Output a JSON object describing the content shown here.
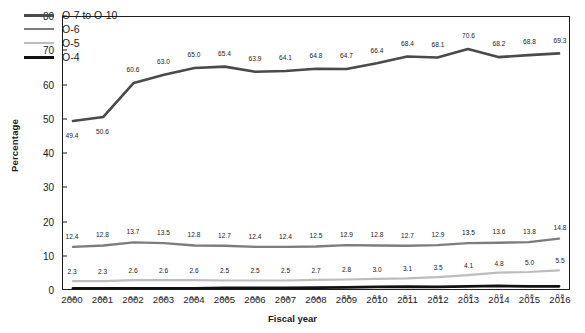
{
  "chart_data": {
    "type": "line",
    "title": "",
    "xlabel": "Fiscal year",
    "ylabel": "Percentage",
    "categories": [
      "2000",
      "2001",
      "2002",
      "2003",
      "2004",
      "2005",
      "2006",
      "2007",
      "2008",
      "2009",
      "2010",
      "2011",
      "2012",
      "2013",
      "2014",
      "2015",
      "2016"
    ],
    "ylim": [
      0,
      80
    ],
    "yticks": [
      0,
      10,
      20,
      30,
      40,
      50,
      60,
      70,
      80
    ],
    "grid": false,
    "legend_position": "top-left",
    "series": [
      {
        "name": "O-7 to O-10",
        "color": "#4a4a4a",
        "values": [
          49.4,
          50.6,
          60.6,
          63.0,
          65.0,
          65.4,
          63.9,
          64.1,
          64.8,
          64.7,
          66.4,
          68.4,
          68.1,
          70.6,
          68.2,
          68.8,
          69.3
        ],
        "labels": [
          "49.4",
          "50.6",
          "60.6",
          "63.0",
          "65.0",
          "65.4",
          "63.9",
          "64.1",
          "64.8",
          "64.7",
          "66.4",
          "68.4",
          "68.1",
          "70.6",
          "68.2",
          "68.8",
          "69.3"
        ]
      },
      {
        "name": "O-6",
        "color": "#7d7d7d",
        "values": [
          12.4,
          12.8,
          13.7,
          13.5,
          12.8,
          12.7,
          12.4,
          12.4,
          12.5,
          12.9,
          12.8,
          12.7,
          12.9,
          13.5,
          13.6,
          13.8,
          14.8
        ],
        "labels": [
          "12.4",
          "12.8",
          "13.7",
          "13.5",
          "12.8",
          "12.7",
          "12.4",
          "12.4",
          "12.5",
          "12.9",
          "12.8",
          "12.7",
          "12.9",
          "13.5",
          "13.6",
          "13.8",
          "14.8"
        ]
      },
      {
        "name": "O-5",
        "color": "#bdbdbd",
        "values": [
          2.3,
          2.3,
          2.6,
          2.6,
          2.6,
          2.5,
          2.5,
          2.5,
          2.7,
          2.8,
          3.0,
          3.1,
          3.5,
          4.1,
          4.8,
          5.0,
          5.5
        ],
        "labels": [
          "2.3",
          "2.3",
          "2.6",
          "2.6",
          "2.6",
          "2.5",
          "2.5",
          "2.5",
          "2.7",
          "2.8",
          "3.0",
          "3.1",
          "3.5",
          "4.1",
          "4.8",
          "5.0",
          "5.5"
        ]
      },
      {
        "name": "O-4",
        "color": "#111111",
        "values": [
          0.2,
          0.2,
          0.2,
          0.2,
          0.2,
          0.3,
          0.3,
          0.3,
          0.4,
          0.5,
          0.6,
          0.7,
          0.6,
          0.8,
          0.9,
          0.8,
          0.8
        ],
        "labels": [
          "0.2",
          "0.2",
          "0.2",
          "0.2",
          "0.2",
          "0.3",
          "0.3",
          "0.3",
          "0.4",
          "0.5",
          "0.6",
          "0.7",
          "0.6",
          "0.8",
          "0.9",
          "0.8",
          "0.8"
        ]
      }
    ]
  }
}
